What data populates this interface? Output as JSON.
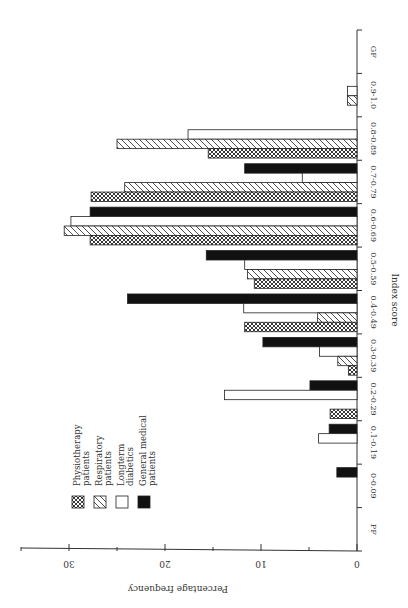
{
  "chart_data": {
    "type": "bar",
    "orientation": "rotated-90",
    "title": "",
    "xlabel": "Index score",
    "ylabel": "Percentage frequency",
    "ylim": [
      0,
      35
    ],
    "yticks": [
      0,
      10,
      20,
      30
    ],
    "categories": [
      "PF",
      "0-0.09",
      "0.1-0.19",
      "0.2-0.29",
      "0.3-0.39",
      "0.4-0.49",
      "0.5-0.59",
      "0.6-0.69",
      "0.7-0.79",
      "0.8-0.89",
      "0.9-1.0",
      "GF"
    ],
    "series": [
      {
        "name": "Physiotherapy patients",
        "pattern": "crosshatch",
        "values": [
          0,
          0,
          0,
          2.8,
          0.9,
          11.7,
          10.7,
          27.8,
          27.7,
          15.5,
          0,
          0
        ]
      },
      {
        "name": "Respiratory patients",
        "pattern": "diagonal",
        "values": [
          0,
          0,
          0,
          0,
          2.0,
          4.1,
          11.4,
          30.5,
          24.2,
          25.0,
          1.0,
          0
        ]
      },
      {
        "name": "Longterm diabetics",
        "pattern": "white",
        "values": [
          0,
          0,
          4.0,
          13.8,
          3.9,
          11.8,
          11.7,
          29.8,
          5.7,
          17.6,
          1.0,
          0
        ]
      },
      {
        "name": "General medical patients",
        "pattern": "black",
        "values": [
          0,
          2.1,
          2.9,
          4.9,
          9.8,
          23.9,
          15.7,
          27.8,
          11.7,
          0,
          0,
          0
        ]
      }
    ],
    "legend_position": "lower-left",
    "grid": false
  }
}
